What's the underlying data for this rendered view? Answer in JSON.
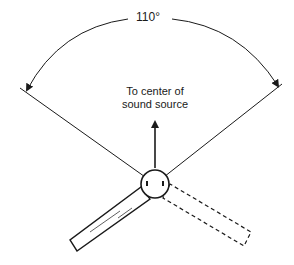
{
  "diagram": {
    "type": "microphone pickup angle diagram",
    "angle_label": "110°",
    "direction_label": {
      "line1": "To center of",
      "line2": "sound source"
    },
    "elements": {
      "microphone_head": "circle",
      "microphone_handle_solid": "handle position (solid)",
      "microphone_handle_dashed": "alternate handle position (dashed)"
    },
    "colors": {
      "stroke": "#1a1a1a",
      "background": "#ffffff"
    }
  }
}
